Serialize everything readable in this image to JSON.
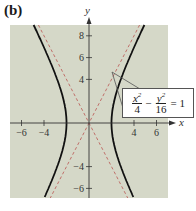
{
  "panel_label": "(b)",
  "chart_data": {
    "type": "line",
    "title": "",
    "equation": "x^2/4 - y^2/16 = 1",
    "equation_parts": {
      "term1_num": "x",
      "term1_den": "4",
      "minus": "−",
      "term2_num": "y",
      "term2_den": "16",
      "equals": "= 1",
      "exp": "2"
    },
    "xlabel": "x",
    "ylabel": "y",
    "xlim": [
      -7,
      7
    ],
    "ylim": [
      -7.5,
      9
    ],
    "x_ticks": [
      -6,
      -4,
      4,
      6
    ],
    "y_ticks": [
      8,
      6,
      4,
      -4,
      -6
    ],
    "grid": false,
    "series": [
      {
        "name": "hyperbola",
        "style": "solid",
        "color": "#111111",
        "function": "x = ±2*sqrt(1 + y^2/16)",
        "vertices": [
          [
            -2,
            0
          ],
          [
            2,
            0
          ]
        ]
      },
      {
        "name": "asymptote y=2x",
        "style": "dashed",
        "color": "#c0706a",
        "slope": 2
      },
      {
        "name": "asymptote y=-2x",
        "style": "dashed",
        "color": "#c0706a",
        "slope": -2
      }
    ],
    "colors": {
      "plot_background": "#d5d8c8",
      "curve": "#111111",
      "asymptote": "#c0706a",
      "axis": "#333333"
    }
  }
}
